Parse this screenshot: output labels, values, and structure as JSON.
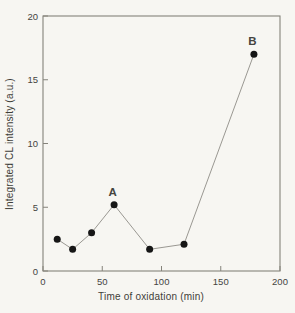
{
  "figure": {
    "background": "#f7f6f2",
    "frame_color": "#85837b",
    "tick_color": "#85837b",
    "line_color": "#9a9892",
    "point_color": "#161616",
    "text_color": "#45443f",
    "annotation_color": "#1b1b18"
  },
  "chart_data": {
    "type": "line",
    "title": "",
    "xlabel": "Time of oxidation (min)",
    "ylabel": "Integrated CL intensity (a.u.)",
    "xlim": [
      0,
      200
    ],
    "ylim": [
      0,
      20
    ],
    "x_ticks": [
      0,
      50,
      100,
      150,
      200
    ],
    "y_ticks": [
      0,
      5,
      10,
      15,
      20
    ],
    "grid": false,
    "legend": false,
    "marker": "filled-circle",
    "series": [
      {
        "name": "Integrated CL intensity",
        "points": [
          {
            "x": 12,
            "y": 2.5
          },
          {
            "x": 25,
            "y": 1.7
          },
          {
            "x": 41,
            "y": 3.0
          },
          {
            "x": 60,
            "y": 5.2,
            "label": "A"
          },
          {
            "x": 90,
            "y": 1.7
          },
          {
            "x": 119,
            "y": 2.1
          },
          {
            "x": 178,
            "y": 17.0,
            "label": "B"
          }
        ]
      }
    ],
    "annotations": [
      {
        "text": "A",
        "x": 60,
        "y": 5.2
      },
      {
        "text": "B",
        "x": 178,
        "y": 17.0
      }
    ]
  }
}
